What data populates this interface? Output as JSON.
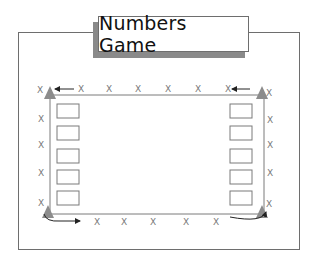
{
  "title": "Numbers Game",
  "marker_label": "X",
  "colors": {
    "frame": "#6e6e6e",
    "track": "#7a7a7a",
    "cone": "#8c8c8c",
    "shadow": "#8a8a8a",
    "arrow": "#222222"
  },
  "layout": {
    "top_row_markers": 6,
    "bottom_row_markers": 5,
    "left_column_markers": 5,
    "right_column_markers": 4,
    "left_boxes": 5,
    "right_boxes": 5,
    "cones": 4
  }
}
